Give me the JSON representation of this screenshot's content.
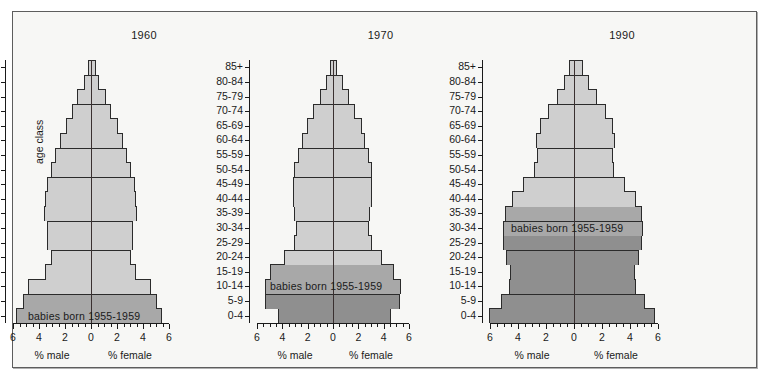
{
  "figure": {
    "axis_label_y": "age class",
    "annotation": "babies born 1955-1959"
  },
  "colors": {
    "band_light": "#cfcfcf",
    "band_mid": "#a8a8a8",
    "band_dark": "#8f8f8f",
    "outline": "#2b2b2b",
    "background": "#f7f7f5",
    "panel_border": "#5d5d5d",
    "centerline": "#3a3030",
    "text": "#1a1a1a"
  },
  "chart_data": {
    "type": "bar",
    "subtype": "population-pyramid",
    "title": "",
    "xlabel_left": "% male",
    "xlabel_right": "% female",
    "ylabel": "age class",
    "xlim": [
      -6,
      6
    ],
    "xticks": [
      6,
      4,
      2,
      0,
      2,
      4,
      6
    ],
    "xtick_labels": [
      "6",
      "4",
      "2",
      "0",
      "2",
      "4",
      "6"
    ],
    "grid": false,
    "legend": "none",
    "categories": [
      "0-4",
      "5-9",
      "10-14",
      "15-19",
      "20-24",
      "25-29",
      "30-34",
      "35-39",
      "40-44",
      "45-49",
      "50-54",
      "55-59",
      "60-64",
      "65-69",
      "70-74",
      "75-79",
      "80-84",
      "85+"
    ],
    "panels": [
      {
        "title": "1960",
        "highlight_classes": [
          "0-4",
          "5-9"
        ],
        "annotation": "babies born 1955-1959",
        "annotation_row": "0-4",
        "series": [
          {
            "name": "% male",
            "side": "left",
            "values": [
              5.75,
              5.25,
              4.85,
              3.55,
              3.05,
              3.35,
              3.35,
              3.65,
              3.55,
              3.35,
              3.05,
              2.75,
              2.35,
              1.95,
              1.45,
              1.05,
              0.55,
              0.25
            ]
          },
          {
            "name": "% female",
            "side": "right",
            "values": [
              5.45,
              5.05,
              4.65,
              3.45,
              3.05,
              3.25,
              3.25,
              3.55,
              3.45,
              3.35,
              3.05,
              2.75,
              2.45,
              2.05,
              1.55,
              1.15,
              0.65,
              0.35
            ]
          }
        ]
      },
      {
        "title": "1970",
        "highlight_classes": [
          "10-14",
          "15-19"
        ],
        "annotation": "babies born 1955-1959",
        "annotation_row": "10-14",
        "series": [
          {
            "name": "% male",
            "side": "left",
            "values": [
              4.35,
              5.35,
              5.35,
              4.95,
              3.85,
              3.05,
              2.95,
              3.05,
              3.15,
              3.15,
              3.05,
              2.75,
              2.45,
              2.05,
              1.55,
              1.05,
              0.55,
              0.25
            ]
          },
          {
            "name": "% female",
            "side": "right",
            "values": [
              4.55,
              5.25,
              5.35,
              4.85,
              3.85,
              3.05,
              2.85,
              2.95,
              3.05,
              3.05,
              3.05,
              2.85,
              2.55,
              2.25,
              1.75,
              1.25,
              0.75,
              0.35
            ]
          }
        ]
      },
      {
        "title": "1990",
        "highlight_classes": [
          "30-34",
          "35-39"
        ],
        "annotation": "babies born 1955-1959",
        "annotation_row": "30-34",
        "series": [
          {
            "name": "% male",
            "side": "left",
            "values": [
              6.05,
              5.25,
              4.65,
              4.55,
              4.85,
              5.05,
              5.05,
              4.95,
              4.45,
              3.65,
              2.85,
              2.65,
              2.75,
              2.45,
              1.85,
              1.25,
              0.75,
              0.35
            ]
          },
          {
            "name": "% female",
            "side": "right",
            "values": [
              5.75,
              5.05,
              4.45,
              4.35,
              4.65,
              4.85,
              4.95,
              4.85,
              4.45,
              3.65,
              2.85,
              2.75,
              2.95,
              2.75,
              2.25,
              1.65,
              1.05,
              0.65
            ]
          }
        ]
      }
    ]
  }
}
